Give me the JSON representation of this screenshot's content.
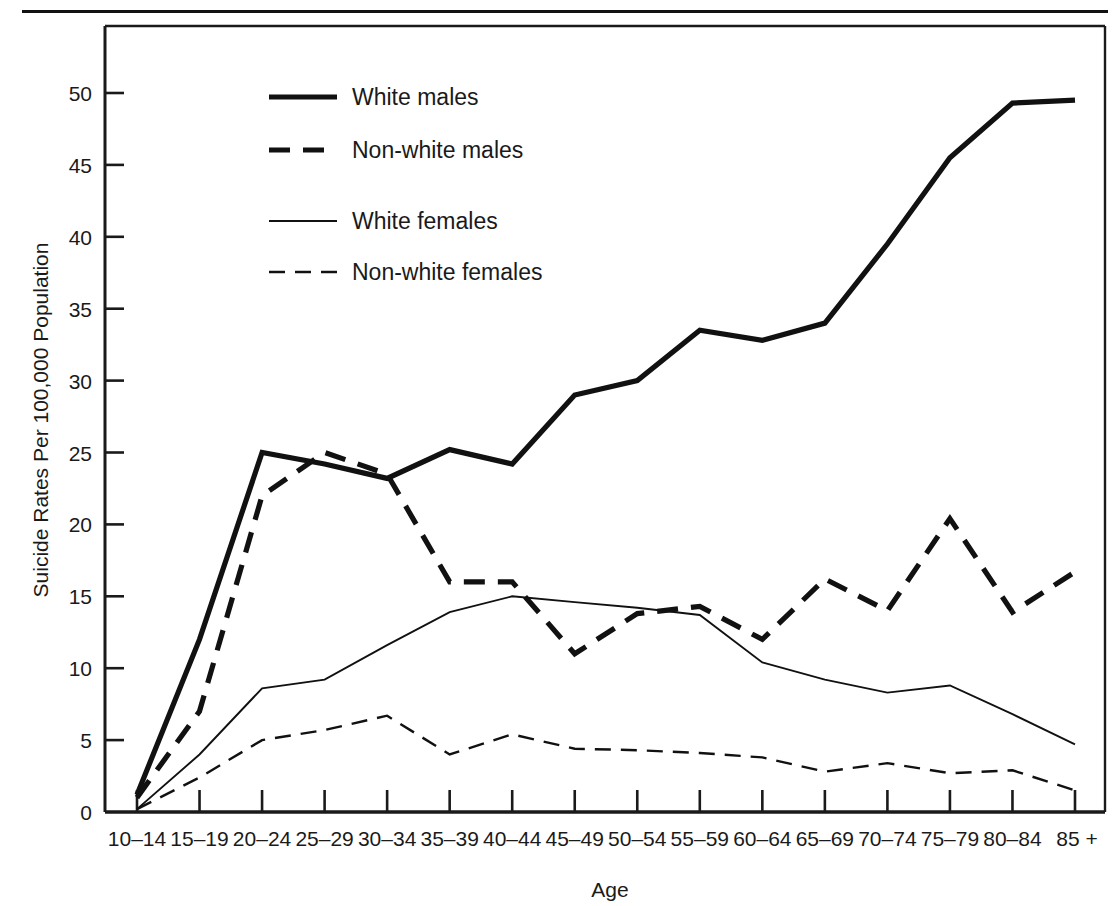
{
  "figure": {
    "y_axis_title": "Suicide Rates Per 100,000 Population",
    "x_axis_title": "Age"
  },
  "legend": {
    "position": "top-center-left",
    "entries": [
      {
        "label": "White males",
        "style": "thick-solid"
      },
      {
        "label": "Non-white males",
        "style": "thick-dashed"
      },
      {
        "label": "White females",
        "style": "thin-solid"
      },
      {
        "label": "Non-white females",
        "style": "thin-dashed"
      }
    ]
  },
  "axes": {
    "y_ticks": [
      "0",
      "5",
      "10",
      "15",
      "20",
      "25",
      "30",
      "35",
      "40",
      "45",
      "50"
    ],
    "x_ticks": [
      "10–14",
      "15–19",
      "20–24",
      "25–29",
      "30–34",
      "35–39",
      "40–44",
      "45–49",
      "50–54",
      "55–59",
      "60–64",
      "65–69",
      "70–74",
      "75–79",
      "80–84",
      "85 +"
    ]
  },
  "chart_data": {
    "type": "line",
    "title": "",
    "xlabel": "Age",
    "ylabel": "Suicide Rates Per 100,000 Population",
    "grid": false,
    "legend_position": "upper-left-inside",
    "ylim": [
      0,
      53
    ],
    "yticks": [
      0,
      5,
      10,
      15,
      20,
      25,
      30,
      35,
      40,
      45,
      50
    ],
    "categories": [
      "10-14",
      "15-19",
      "20-24",
      "25-29",
      "30-34",
      "35-39",
      "40-44",
      "45-49",
      "50-54",
      "55-59",
      "60-64",
      "65-69",
      "70-74",
      "75-79",
      "80-84",
      "85+"
    ],
    "series": [
      {
        "name": "White males",
        "style": "thick-solid",
        "values": [
          1.2,
          12.0,
          25.0,
          24.2,
          23.2,
          25.2,
          24.2,
          29.0,
          30.0,
          33.5,
          32.8,
          34.0,
          39.5,
          45.5,
          49.3,
          49.5
        ]
      },
      {
        "name": "Non-white males",
        "style": "thick-dashed",
        "values": [
          1.0,
          7.0,
          22.0,
          25.0,
          23.5,
          16.0,
          16.0,
          11.0,
          13.8,
          14.3,
          12.0,
          16.2,
          14.0,
          20.4,
          13.9,
          16.7
        ]
      },
      {
        "name": "White females",
        "style": "thin-solid",
        "values": [
          0.2,
          4.0,
          8.6,
          9.2,
          11.6,
          13.9,
          15.0,
          14.6,
          14.2,
          13.7,
          10.4,
          9.2,
          8.3,
          8.8,
          6.8,
          4.7
        ]
      },
      {
        "name": "Non-white females",
        "style": "thin-dashed",
        "values": [
          0.2,
          2.4,
          5.0,
          5.7,
          6.7,
          4.0,
          5.4,
          4.4,
          4.3,
          4.1,
          3.8,
          2.8,
          3.4,
          2.7,
          2.9,
          1.5
        ]
      }
    ]
  }
}
